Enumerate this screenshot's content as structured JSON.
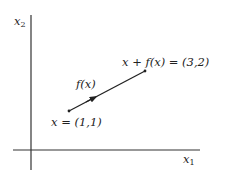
{
  "diagram": {
    "type": "vector-addition-plot",
    "axes": {
      "x_axis": {
        "label_base": "x",
        "label_sub": "1"
      },
      "y_axis": {
        "label_base": "x",
        "label_sub": "2"
      }
    },
    "points": {
      "start": {
        "label": "x = (1,1)",
        "coords": [
          1,
          1
        ]
      },
      "end": {
        "label": "x + f(x) = (3,2)",
        "coords": [
          3,
          2
        ]
      }
    },
    "vector": {
      "label": "f(x)",
      "from": [
        1,
        1
      ],
      "to": [
        3,
        2
      ]
    },
    "colors": {
      "axis": "#333333",
      "vector": "#222222",
      "text": "#222222",
      "background": "#ffffff"
    }
  }
}
